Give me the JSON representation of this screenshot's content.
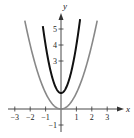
{
  "chart_data": {
    "type": "line",
    "title": "",
    "xlabel": "x",
    "ylabel": "y",
    "xlim": [
      -3.3,
      3.6
    ],
    "ylim": [
      -1.5,
      6.2
    ],
    "grid": false,
    "x_ticks": [
      -3,
      -2,
      -1,
      1,
      2,
      3
    ],
    "x_tick_labels": [
      "−3",
      "−2",
      "−1",
      "1",
      "2",
      "3"
    ],
    "y_ticks": [
      -1,
      3,
      4,
      5
    ],
    "y_tick_labels": [
      "−1",
      "3",
      "4",
      "5"
    ],
    "series": [
      {
        "name": "y = x^2",
        "color": "#888888",
        "equation": "x^2",
        "x_range": [
          -2.35,
          2.35
        ]
      },
      {
        "name": "y = 3x^2 + 1",
        "color": "#111111",
        "equation": "3x^2+1",
        "x_range": [
          -1.18,
          1.24
        ]
      }
    ]
  },
  "colors": {
    "axis": "#333333",
    "gray_curve": "#888888",
    "black_curve": "#111111"
  }
}
